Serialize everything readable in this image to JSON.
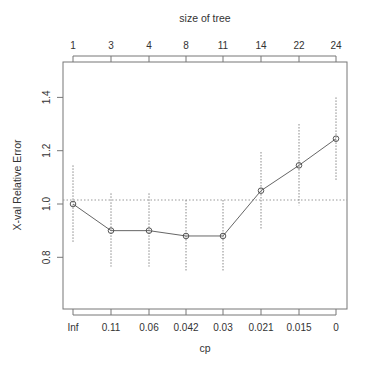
{
  "chart_data": {
    "type": "line",
    "title": "",
    "xlabel": "cp",
    "ylabel": "X-val Relative Error",
    "top_axis_label": "size of tree",
    "categories": [
      "Inf",
      "0.11",
      "0.06",
      "0.042",
      "0.03",
      "0.021",
      "0.015",
      "0"
    ],
    "top_tick_labels": [
      "1",
      "3",
      "4",
      "8",
      "11",
      "14",
      "22",
      "24"
    ],
    "series": [
      {
        "name": "X-val Relative Error",
        "values": [
          1.0,
          0.9,
          0.9,
          0.88,
          0.88,
          1.05,
          1.145,
          1.245
        ],
        "upper": [
          1.145,
          1.04,
          1.04,
          1.015,
          1.015,
          1.195,
          1.3,
          1.4
        ],
        "lower": [
          0.855,
          0.765,
          0.765,
          0.745,
          0.745,
          0.905,
          0.995,
          1.09
        ]
      }
    ],
    "reference_line": 1.015,
    "yticks": [
      "0.8",
      "1.0",
      "1.2",
      "1.4"
    ],
    "ylim": [
      0.63,
      1.55
    ],
    "grid": false,
    "legend": "none"
  }
}
